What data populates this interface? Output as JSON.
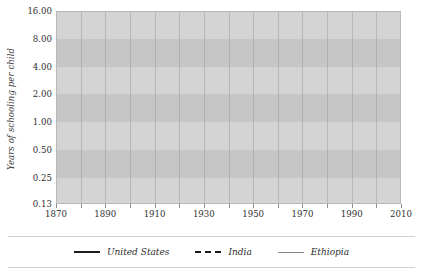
{
  "chart_data": {
    "type": "line",
    "title": "",
    "xlabel": "",
    "ylabel": "Years of schooling per child",
    "log_y": true,
    "xlim": [
      1870,
      2010
    ],
    "ylim": [
      0.13,
      16.0
    ],
    "grid": true,
    "legend_position": "bottom",
    "x_ticks": [
      "1870",
      "1890",
      "1910",
      "1930",
      "1950",
      "1970",
      "1990",
      "2010"
    ],
    "x_minor_step": 10,
    "y_ticks": [
      "16.00",
      "8.00",
      "4.00",
      "2.00",
      "1.00",
      "0.50",
      "0.25",
      "0.13"
    ],
    "y_tick_values": [
      16.0,
      8.0,
      4.0,
      2.0,
      1.0,
      0.5,
      0.25,
      0.13
    ],
    "series": [
      {
        "name": "United States",
        "style": "solid-thick",
        "color": "#1c1c1c",
        "x": [
          1870,
          1880,
          1890,
          1900,
          1910,
          1920,
          1930,
          1940,
          1950,
          1960,
          1970,
          1980,
          1990,
          2000,
          2010
        ],
        "values": [
          5.5,
          5.8,
          6.1,
          6.4,
          6.7,
          7.0,
          7.4,
          7.9,
          8.4,
          9.0,
          9.6,
          10.3,
          11.0,
          11.6,
          12.0
        ]
      },
      {
        "name": "India",
        "style": "dashed",
        "color": "#1c1c1c",
        "x": [
          1918,
          1920,
          1930,
          1940,
          1950,
          1960,
          1970,
          1980,
          1990,
          2000,
          2010
        ],
        "values": [
          0.13,
          0.16,
          0.32,
          0.55,
          0.85,
          1.25,
          1.75,
          2.35,
          3.0,
          3.8,
          4.7
        ]
      },
      {
        "name": "Ethiopia",
        "style": "solid-thin",
        "color": "#8a8a8a",
        "x": [
          1962,
          1970,
          1980,
          1990,
          2000,
          2010
        ],
        "values": [
          0.13,
          0.3,
          0.85,
          1.85,
          2.35,
          2.65
        ]
      }
    ]
  },
  "legend": {
    "items": [
      {
        "label": "United States",
        "swatch": "solid-thick-line-icon"
      },
      {
        "label": "India",
        "swatch": "dashed-line-icon"
      },
      {
        "label": "Ethiopia",
        "swatch": "thin-line-icon"
      }
    ]
  }
}
